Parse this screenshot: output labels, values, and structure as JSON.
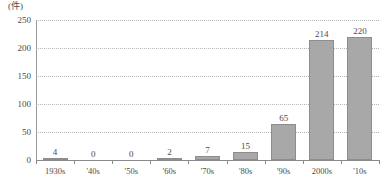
{
  "chart_data": {
    "type": "bar",
    "title": "",
    "subtitle": "",
    "xlabel": "",
    "ylabel": "",
    "unit_label": "(件)",
    "categories": [
      "1930s",
      "'40s",
      "'50s",
      "'60s",
      "'70s",
      "'80s",
      "'90s",
      "2000s",
      "'10s"
    ],
    "values": [
      4,
      0,
      0,
      2,
      7,
      15,
      65,
      214,
      220
    ],
    "value_labels": [
      "4",
      "0",
      "0",
      "2",
      "7",
      "15",
      "65",
      "214",
      "220"
    ],
    "ylim": [
      0,
      250
    ],
    "yticks": [
      0,
      50,
      100,
      150,
      200,
      250
    ],
    "ytick_labels": [
      "0",
      "50",
      "100",
      "150",
      "200",
      "250"
    ],
    "grid": true,
    "grid_axis": "y",
    "grid_style": "dotted",
    "legend": null,
    "legend_position": "none",
    "series": [
      {
        "name": "",
        "values": [
          4,
          0,
          0,
          2,
          7,
          15,
          65,
          214,
          220
        ]
      }
    ],
    "colors": {
      "bar_fill": "#a8a8a8",
      "bar_stroke": "#8d8d8d",
      "gridline": "#b5b5b5",
      "axis": "#8a8a8a",
      "text": "#4a4a4a",
      "background": "#ffffff"
    }
  }
}
